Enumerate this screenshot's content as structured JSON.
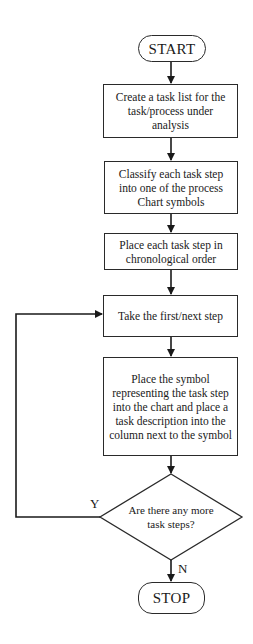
{
  "flowchart": {
    "start": {
      "label": "START"
    },
    "steps": [
      {
        "label": "Create a task list for the task/process under analysis"
      },
      {
        "label": "Classify each task step into one of the process Chart symbols"
      },
      {
        "label": "Place each task step in chronological order"
      },
      {
        "label": "Take the first/next step"
      },
      {
        "label": "Place the symbol representing the task step into the chart and place a task description into the column next to the symbol"
      }
    ],
    "decision": {
      "label": "Are there any more task steps?"
    },
    "edges": {
      "yes_label": "Y",
      "no_label": "N"
    },
    "stop": {
      "label": "STOP"
    }
  },
  "colors": {
    "line": "#1a1a1a",
    "background": "#ffffff"
  }
}
